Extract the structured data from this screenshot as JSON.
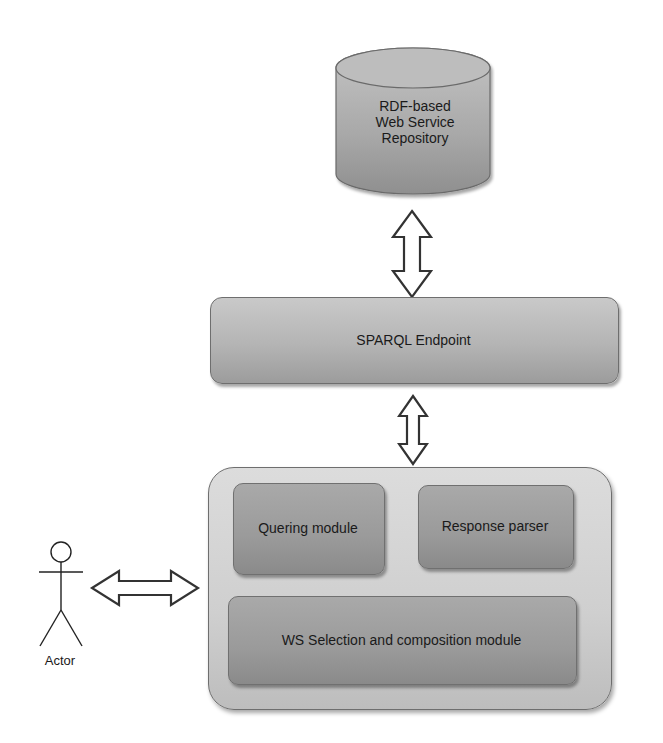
{
  "diagram": {
    "repository": {
      "label_lines": [
        "RDF-based",
        "Web Service",
        "Repository"
      ],
      "shape": "cylinder"
    },
    "sparql_endpoint": {
      "label": "SPARQL Endpoint"
    },
    "system": {
      "modules": {
        "quering": {
          "label": "Quering module"
        },
        "response_parser": {
          "label": "Response parser"
        },
        "ws_selection": {
          "label": "WS Selection and composition module"
        }
      }
    },
    "actor": {
      "label": "Actor",
      "icon": "stick-figure-icon"
    },
    "connectors": [
      {
        "from": "repository",
        "to": "sparql_endpoint",
        "type": "bidirectional-block-arrow"
      },
      {
        "from": "sparql_endpoint",
        "to": "system",
        "type": "bidirectional-block-arrow"
      },
      {
        "from": "actor",
        "to": "system",
        "type": "bidirectional-block-arrow"
      }
    ],
    "colors": {
      "box_fill": "#b4b4b4",
      "inner_fill": "#9a9a9a",
      "container_fill": "#d0d0d0",
      "stroke": "#6e6e6e"
    }
  }
}
